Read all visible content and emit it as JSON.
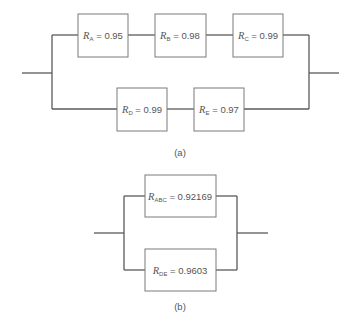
{
  "diagram_a": {
    "caption": "(a)",
    "blocks": [
      {
        "symbol": "R",
        "sub": "A",
        "eq": " = 0.95"
      },
      {
        "symbol": "R",
        "sub": "B",
        "eq": " = 0.98"
      },
      {
        "symbol": "R",
        "sub": "C",
        "eq": " = 0.99"
      },
      {
        "symbol": "R",
        "sub": "D",
        "eq": " = 0.99"
      },
      {
        "symbol": "R",
        "sub": "E",
        "eq": " = 0.97"
      }
    ]
  },
  "diagram_b": {
    "caption": "(b)",
    "blocks": [
      {
        "symbol": "R",
        "sub": "ABC",
        "eq": " = 0.92169"
      },
      {
        "symbol": "R",
        "sub": "DE",
        "eq": " = 0.9603"
      }
    ]
  }
}
